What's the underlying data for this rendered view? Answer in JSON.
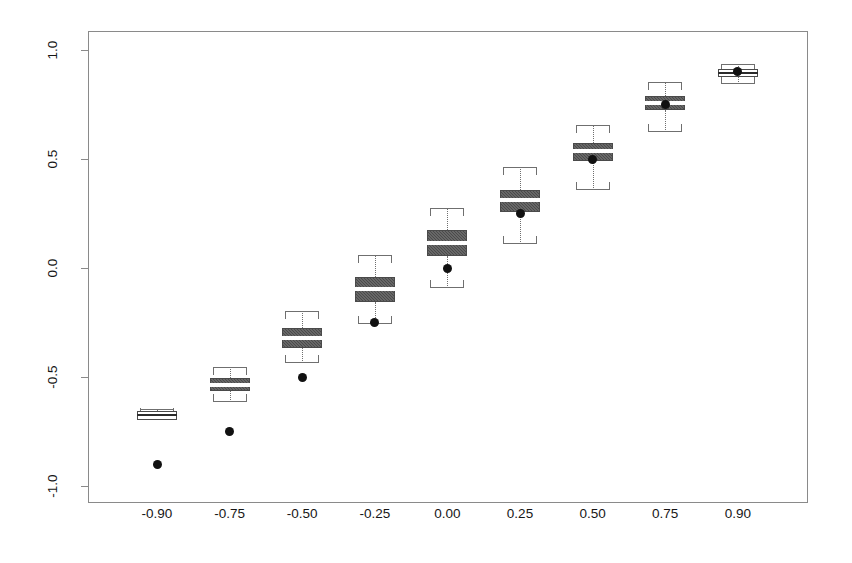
{
  "figure": {
    "type": "boxplot-figure",
    "background": "#ffffff",
    "frame_color": "#8a8a8a",
    "box_fill": "#4a4a4a",
    "median_color": "#ffffff",
    "point_color": "#111111"
  },
  "axes": {
    "y_ticks": [
      "1.0",
      "0.5",
      "0.0",
      "-0.5",
      "-1.0"
    ],
    "y_tick_values": [
      1.0,
      0.5,
      0.0,
      -0.5,
      -1.0
    ],
    "x_ticks": [
      "-0.90",
      "-0.75",
      "-0.50",
      "-0.25",
      "0.00",
      "0.25",
      "0.50",
      "0.75",
      "0.90"
    ],
    "x_tick_values": [
      -0.9,
      -0.75,
      -0.5,
      -0.25,
      0.0,
      0.25,
      0.5,
      0.75,
      0.9
    ],
    "xlabel": "",
    "ylabel": "",
    "title": "",
    "grid": false,
    "ylim": [
      -1.1,
      1.1
    ]
  },
  "chart_data": {
    "type": "box",
    "title": "",
    "subtitle": "",
    "xlabel": "",
    "ylabel": "",
    "grid": false,
    "legend": [],
    "ylim": [
      -1.1,
      1.1
    ],
    "categories": [
      "-0.90",
      "-0.75",
      "-0.50",
      "-0.25",
      "0.00",
      "0.25",
      "0.50",
      "0.75",
      "0.90"
    ],
    "boxes": [
      {
        "category": "-0.90",
        "whisker_low": -0.68,
        "q1": -0.695,
        "median": -0.675,
        "q3": -0.655,
        "whisker_high": -0.645,
        "reference_point": -0.9
      },
      {
        "category": "-0.75",
        "whisker_low": -0.615,
        "q1": -0.565,
        "median": -0.535,
        "q3": -0.505,
        "whisker_high": -0.455,
        "reference_point": -0.75
      },
      {
        "category": "-0.50",
        "whisker_low": -0.435,
        "q1": -0.365,
        "median": -0.32,
        "q3": -0.275,
        "whisker_high": -0.195,
        "reference_point": -0.5
      },
      {
        "category": "-0.25",
        "whisker_low": -0.255,
        "q1": -0.155,
        "median": -0.095,
        "q3": -0.04,
        "whisker_high": 0.06,
        "reference_point": -0.25
      },
      {
        "category": "0.00",
        "whisker_low": -0.09,
        "q1": 0.055,
        "median": 0.115,
        "q3": 0.175,
        "whisker_high": 0.275,
        "reference_point": 0.0
      },
      {
        "category": "0.25",
        "whisker_low": 0.11,
        "q1": 0.255,
        "median": 0.31,
        "q3": 0.36,
        "whisker_high": 0.465,
        "reference_point": 0.25
      },
      {
        "category": "0.50",
        "whisker_low": 0.36,
        "q1": 0.49,
        "median": 0.535,
        "q3": 0.575,
        "whisker_high": 0.655,
        "reference_point": 0.5
      },
      {
        "category": "0.75",
        "whisker_low": 0.625,
        "q1": 0.725,
        "median": 0.755,
        "q3": 0.79,
        "whisker_high": 0.855,
        "reference_point": 0.75
      },
      {
        "category": "0.90",
        "whisker_low": 0.845,
        "q1": 0.875,
        "median": 0.895,
        "q3": 0.915,
        "whisker_high": 0.935,
        "reference_point": 0.9
      }
    ],
    "reference_points": {
      "name": "true value",
      "x": [
        "-0.90",
        "-0.75",
        "-0.50",
        "-0.25",
        "0.00",
        "0.25",
        "0.50",
        "0.75",
        "0.90"
      ],
      "y": [
        -0.9,
        -0.75,
        -0.5,
        -0.25,
        0.0,
        0.25,
        0.5,
        0.75,
        0.9
      ]
    }
  }
}
